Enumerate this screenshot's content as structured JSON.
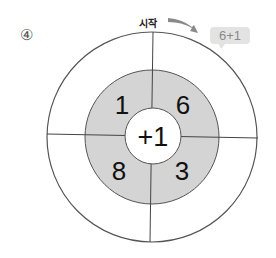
{
  "problem": {
    "number": "④"
  },
  "start": {
    "label": "시작",
    "arrow_icon": "curved-arrow-icon"
  },
  "bubble": {
    "text": "6+1"
  },
  "wheel": {
    "center_label": "+1",
    "segments": [
      {
        "position": "top-left",
        "value": "1"
      },
      {
        "position": "top-right",
        "value": "6"
      },
      {
        "position": "bottom-left",
        "value": "8"
      },
      {
        "position": "bottom-right",
        "value": "3"
      }
    ],
    "colors": {
      "ring_fill": "#d4d4d4",
      "line": "#444444",
      "center_fill": "#ffffff"
    }
  }
}
